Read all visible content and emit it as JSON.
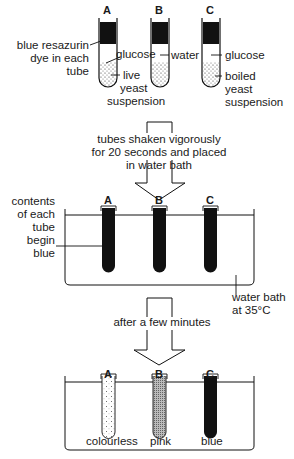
{
  "stage1": {
    "tubes": [
      {
        "letter": "A",
        "contents": "glucose",
        "suspension": "live yeast suspension"
      },
      {
        "letter": "B",
        "contents": "water",
        "suspension": "live yeast suspension"
      },
      {
        "letter": "C",
        "contents": "glucose",
        "suspension": "boiled yeast suspension"
      }
    ],
    "dye_label": [
      "blue resazurin",
      "dye in each",
      "tube"
    ],
    "glucose_label": "glucose",
    "water_label": "water",
    "live_label": [
      "live",
      "yeast",
      "suspension"
    ],
    "c_glucose_label": "glucose",
    "boiled_label": [
      "boiled",
      "yeast",
      "suspension"
    ]
  },
  "step1": {
    "text": [
      "tubes shaken vigorously",
      "for 20 seconds and placed",
      "in water bath"
    ]
  },
  "stage2": {
    "letters": [
      "A",
      "B",
      "C"
    ],
    "start_label": [
      "contents",
      "of each",
      "tube",
      "begin",
      "blue"
    ],
    "bath_label": [
      "water bath",
      "at 35°C"
    ]
  },
  "step2": {
    "text": "after a few minutes"
  },
  "stage3": {
    "letters": [
      "A",
      "B",
      "C"
    ],
    "results": [
      "colourless",
      "pink",
      "blue"
    ]
  },
  "colors": {
    "ink": "#1a1a1a",
    "background": "#ffffff"
  }
}
